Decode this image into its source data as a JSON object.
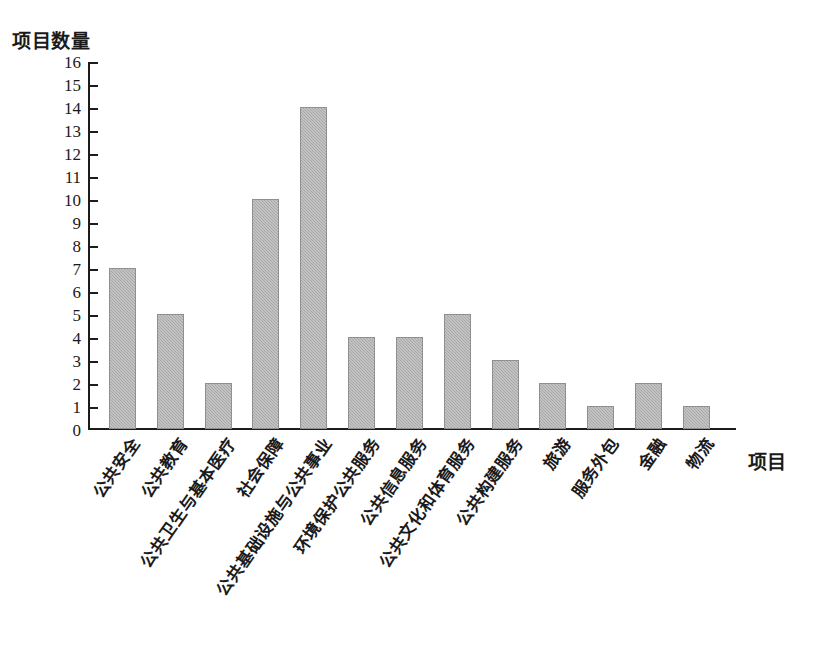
{
  "chart_data": {
    "type": "bar",
    "title": "",
    "ylabel": "项目数量",
    "xlabel": "项目",
    "ylim": [
      0,
      16
    ],
    "ytick_step": 1,
    "grid": false,
    "legend": false,
    "bar_color": "#a8a8a8",
    "axis_color": "#1c1c1c",
    "categories": [
      "公共安全",
      "公共教育",
      "公共卫生与基本医疗",
      "社会保障",
      "公共基础设施与公共事业",
      "环境保护公共服务",
      "公共信息服务",
      "公共文化和体育服务",
      "公共构建服务",
      "旅游",
      "服务外包",
      "金融",
      "物流"
    ],
    "values": [
      7,
      5,
      2,
      10,
      14,
      4,
      4,
      5,
      3,
      2,
      1,
      2,
      1
    ],
    "ytick_labels": [
      "0",
      "1",
      "2",
      "3",
      "4",
      "5",
      "6",
      "7",
      "8",
      "9",
      "10",
      "11",
      "12",
      "13",
      "14",
      "15",
      "16"
    ]
  }
}
